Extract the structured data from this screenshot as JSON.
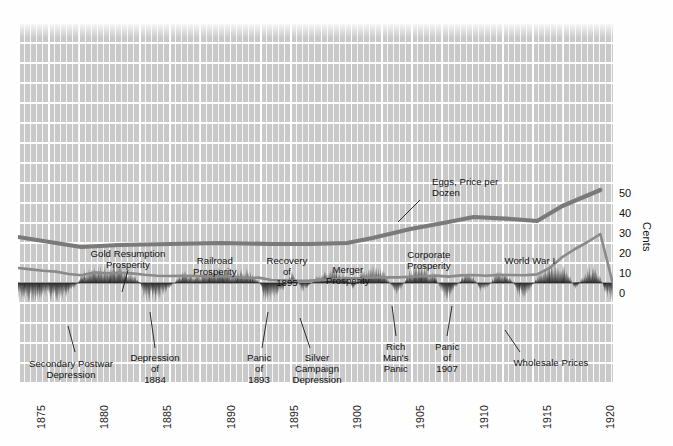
{
  "chart_data": {
    "type": "line",
    "title": "",
    "xlabel": "",
    "ylabel": "Cents",
    "xlim": [
      1874,
      1921
    ],
    "ylim": [
      0,
      55
    ],
    "grid": true,
    "legend": "inline-annotations",
    "xticks": [
      "1875",
      "1880",
      "1885",
      "1890",
      "1895",
      "1900",
      "1905",
      "1910",
      "1915",
      "1920"
    ],
    "yticks": [
      "0",
      "10",
      "20",
      "30",
      "40",
      "50"
    ],
    "series": [
      {
        "name": "Eggs, Price per Dozen",
        "units": "cents per dozen",
        "color": "#7a7a7a",
        "x": [
          1874,
          1876,
          1879,
          1882,
          1886,
          1890,
          1894,
          1897,
          1900,
          1902,
          1905,
          1908,
          1910,
          1913,
          1915,
          1917,
          1920
        ],
        "values": [
          28.5,
          26.5,
          23.5,
          24.5,
          25.0,
          25.5,
          25.0,
          25.0,
          25.5,
          28.0,
          32.5,
          36.0,
          38.5,
          37.5,
          36.5,
          44.0,
          52.0
        ]
      },
      {
        "name": "Wholesale Prices",
        "units": "index, cents scale",
        "color": "#8a8a8a",
        "x": [
          1874,
          1875,
          1876,
          1877,
          1878,
          1879,
          1880,
          1881,
          1882,
          1883,
          1884,
          1885,
          1886,
          1887,
          1888,
          1889,
          1890,
          1891,
          1892,
          1893,
          1894,
          1895,
          1896,
          1897,
          1898,
          1899,
          1900,
          1901,
          1902,
          1903,
          1904,
          1905,
          1906,
          1907,
          1908,
          1909,
          1910,
          1911,
          1912,
          1913,
          1914,
          1915,
          1916,
          1917,
          1918,
          1919,
          1920,
          1921
        ],
        "values": [
          13.0,
          12.3,
          11.6,
          11.2,
          10.0,
          9.4,
          10.8,
          10.4,
          10.6,
          10.3,
          9.6,
          9.1,
          9.0,
          9.1,
          9.0,
          8.8,
          8.9,
          8.6,
          8.0,
          8.2,
          7.0,
          6.9,
          6.6,
          6.7,
          7.0,
          7.4,
          7.9,
          7.8,
          8.4,
          8.3,
          8.3,
          8.6,
          8.9,
          9.2,
          8.7,
          9.3,
          9.5,
          9.1,
          9.6,
          9.5,
          9.4,
          9.8,
          13.0,
          18.5,
          22.5,
          26.0,
          30.0,
          5.0
        ]
      },
      {
        "name": "Business Cycle (expansion/contraction band)",
        "type": "area-oscillation",
        "baseline_cents": 5.5,
        "color": "#2a2a2a"
      }
    ],
    "annotations": [
      {
        "id": "gold-resumption",
        "text": "Gold Resumption\nProsperity",
        "x": 128,
        "y": 248,
        "align": "center",
        "leader": [
          [
            128,
            270
          ],
          [
            122,
            292
          ]
        ]
      },
      {
        "id": "railroad",
        "text": "Railroad\nProsperity",
        "x": 215,
        "y": 255,
        "align": "center",
        "leader": null
      },
      {
        "id": "recovery-1895",
        "text": "Recovery\nof\n1895",
        "x": 287,
        "y": 255,
        "align": "center",
        "leader": null
      },
      {
        "id": "merger",
        "text": "Merger\nProsperity",
        "x": 348,
        "y": 264,
        "align": "center",
        "leader": null
      },
      {
        "id": "corporate",
        "text": "Corporate\nProsperity",
        "x": 429,
        "y": 249,
        "align": "center",
        "leader": null
      },
      {
        "id": "world-war-i",
        "text": "World War I",
        "x": 530,
        "y": 255,
        "align": "center",
        "leader": null
      },
      {
        "id": "eggs-label",
        "text": "Eggs, Price per\nDozen",
        "x": 432,
        "y": 176,
        "align": "left",
        "leader": [
          [
            420,
            200
          ],
          [
            398,
            222
          ]
        ]
      },
      {
        "id": "wholesale-label",
        "text": "Wholesale Prices",
        "x": 551,
        "y": 357,
        "align": "center",
        "leader": [
          [
            520,
            352
          ],
          [
            505,
            330
          ]
        ]
      },
      {
        "id": "secondary-postwar",
        "text": "Secondary Postwar\nDepression",
        "x": 71,
        "y": 358,
        "align": "center",
        "leader": [
          [
            75,
            352
          ],
          [
            68,
            326
          ]
        ]
      },
      {
        "id": "depression-1884",
        "text": "Depression\nof\n1884",
        "x": 155,
        "y": 352,
        "align": "center",
        "leader": [
          [
            155,
            348
          ],
          [
            150,
            312
          ]
        ]
      },
      {
        "id": "panic-1893",
        "text": "Panic\nof\n1893",
        "x": 259,
        "y": 352,
        "align": "center",
        "leader": [
          [
            262,
            348
          ],
          [
            268,
            312
          ]
        ]
      },
      {
        "id": "silver-campaign",
        "text": "Silver\nCampaign\nDepression",
        "x": 317,
        "y": 352,
        "align": "center",
        "leader": [
          [
            310,
            348
          ],
          [
            300,
            318
          ]
        ]
      },
      {
        "id": "rich-mans-panic",
        "text": "Rich\nMan's\nPanic",
        "x": 396,
        "y": 341,
        "align": "center",
        "leader": [
          [
            396,
            336
          ],
          [
            392,
            306
          ]
        ]
      },
      {
        "id": "panic-1907",
        "text": "Panic\nof\n1907",
        "x": 447,
        "y": 341,
        "align": "center",
        "leader": [
          [
            447,
            336
          ],
          [
            452,
            306
          ]
        ]
      }
    ]
  },
  "axes": {
    "y_label": "Cents",
    "y_ticks": [
      {
        "label": "50",
        "cents": 50
      },
      {
        "label": "40",
        "cents": 40
      },
      {
        "label": "30",
        "cents": 30
      },
      {
        "label": "20",
        "cents": 20
      },
      {
        "label": "10",
        "cents": 10
      },
      {
        "label": "0",
        "cents": 0
      }
    ],
    "x_ticks": [
      {
        "label": "1875",
        "year": 1875
      },
      {
        "label": "1880",
        "year": 1880
      },
      {
        "label": "1885",
        "year": 1885
      },
      {
        "label": "1890",
        "year": 1890
      },
      {
        "label": "1895",
        "year": 1895
      },
      {
        "label": "1900",
        "year": 1900
      },
      {
        "label": "1905",
        "year": 1905
      },
      {
        "label": "1910",
        "year": 1910
      },
      {
        "label": "1915",
        "year": 1915
      },
      {
        "label": "1920",
        "year": 1920
      }
    ]
  },
  "colors": {
    "plot_background": "#c9c9c9",
    "gridline": "#ffffff",
    "eggs_line": "#7a7a7a",
    "wholesale_line": "#8a8a8a",
    "cycle_band": "#2a2a2a",
    "text": "#111111",
    "page_background": "#fefefe"
  }
}
